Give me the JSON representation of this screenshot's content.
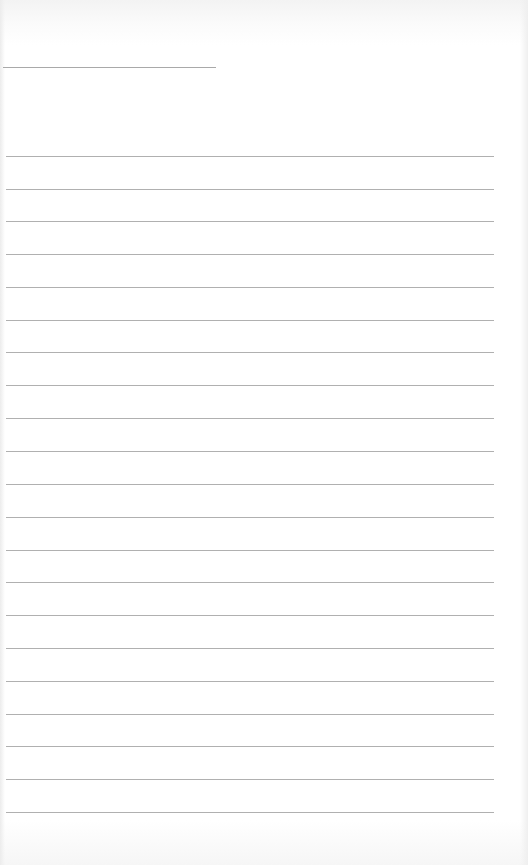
{
  "document": {
    "type": "lined-paper",
    "title_field": {
      "value": ""
    },
    "lines": [
      {
        "top": 156,
        "value": ""
      },
      {
        "top": 189,
        "value": ""
      },
      {
        "top": 221,
        "value": ""
      },
      {
        "top": 254,
        "value": ""
      },
      {
        "top": 287,
        "value": ""
      },
      {
        "top": 320,
        "value": ""
      },
      {
        "top": 352,
        "value": ""
      },
      {
        "top": 385,
        "value": ""
      },
      {
        "top": 418,
        "value": ""
      },
      {
        "top": 451,
        "value": ""
      },
      {
        "top": 484,
        "value": ""
      },
      {
        "top": 517,
        "value": ""
      },
      {
        "top": 550,
        "value": ""
      },
      {
        "top": 582,
        "value": ""
      },
      {
        "top": 615,
        "value": ""
      },
      {
        "top": 648,
        "value": ""
      },
      {
        "top": 681,
        "value": ""
      },
      {
        "top": 714,
        "value": ""
      },
      {
        "top": 746,
        "value": ""
      },
      {
        "top": 779,
        "value": ""
      },
      {
        "top": 812,
        "value": ""
      }
    ],
    "colors": {
      "paper": "#ffffff",
      "rule": "#b0b0b0"
    }
  }
}
